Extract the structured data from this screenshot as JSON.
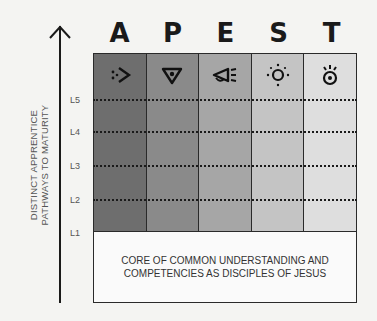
{
  "axis": {
    "label_line1": "DISTINCT APPRENTICE",
    "label_line2": "PATHWAYS TO MATURITY",
    "levels": [
      "L5",
      "L4",
      "L3",
      "L2",
      "L1"
    ]
  },
  "columns": [
    {
      "letter": "A",
      "icon": "apostle-arrow-icon",
      "color": "#6e6e6e"
    },
    {
      "letter": "P",
      "icon": "prophet-eye-triangle-icon",
      "color": "#8a8a8a"
    },
    {
      "letter": "E",
      "icon": "evangelist-megaphone-icon",
      "color": "#a6a6a6"
    },
    {
      "letter": "S",
      "icon": "shepherd-sun-icon",
      "color": "#c4c4c4"
    },
    {
      "letter": "T",
      "icon": "teacher-lightbulb-icon",
      "color": "#dedede"
    }
  ],
  "core": {
    "line1": "CORE OF COMMON UNDERSTANDING AND",
    "line2": "COMPETENCIES AS DISCIPLES OF JESUS"
  }
}
